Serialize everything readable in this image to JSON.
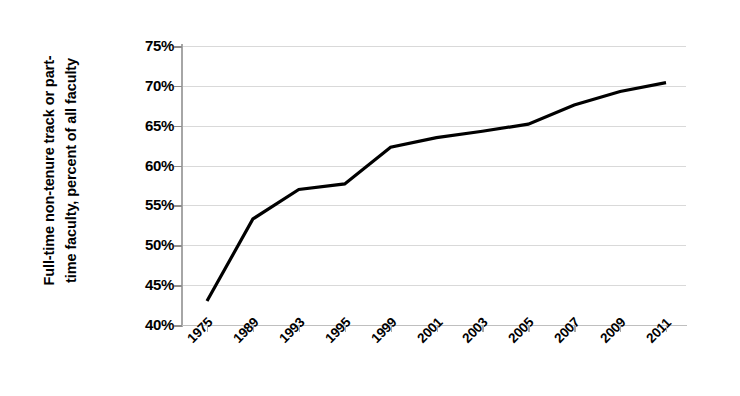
{
  "chart_data": {
    "type": "line",
    "title": "",
    "xlabel": "",
    "ylabel": "Full-time non-tenure track or part-time faculty, percent of all faculty",
    "ylabel_line1": "Full-time non-tenure track or part-",
    "ylabel_line2": "time faculty, percent of all faculty",
    "categories": [
      "1975",
      "1989",
      "1993",
      "1995",
      "1999",
      "2001",
      "2003",
      "2005",
      "2007",
      "2009",
      "2011"
    ],
    "values": [
      43.0,
      53.3,
      57.0,
      57.7,
      62.3,
      63.5,
      64.3,
      65.2,
      67.6,
      69.3,
      70.4
    ],
    "series": [
      {
        "name": "Full-time non-tenure track or part-time faculty",
        "values": [
          43.0,
          53.3,
          57.0,
          57.7,
          62.3,
          63.5,
          64.3,
          65.2,
          67.6,
          69.3,
          70.4
        ]
      }
    ],
    "ylim": [
      40,
      75
    ],
    "ytick_values": [
      40,
      45,
      50,
      55,
      60,
      65,
      70,
      75
    ],
    "ytick_labels": [
      "40%",
      "45%",
      "50%",
      "55%",
      "60%",
      "65%",
      "70%",
      "75%"
    ],
    "grid": true,
    "grid_axis": "y",
    "legend": false,
    "legend_position": "none",
    "line_color": "#000000",
    "line_width": 3.2,
    "markers": false,
    "gridline_color": "#d9d9d9",
    "axis_color": "#a6a6a6",
    "background_color": "#ffffff",
    "text_color": "#000000"
  }
}
